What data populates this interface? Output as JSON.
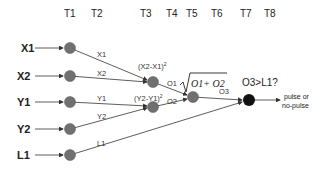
{
  "time_steps": [
    "T1",
    "T2",
    "T3",
    "T4",
    "T5",
    "T6",
    "T7",
    "T8"
  ],
  "inputs": [
    "X1",
    "X2",
    "Y1",
    "Y2",
    "L1"
  ],
  "edges": {
    "x1": "X1",
    "x2": "X2",
    "y1": "Y1",
    "y2": "Y2",
    "l1": "L1",
    "o1": "O1",
    "o2": "O2",
    "o3": "O3"
  },
  "formulas": {
    "dx": "(X2-X1)",
    "dy": "(Y2-Y1)",
    "sq": "2",
    "sqrt": "O1+ O2"
  },
  "decision": "O3>L1?",
  "output_line1": "pulse or",
  "output_line2": "no-pulse",
  "colors": {
    "node": "#707070",
    "output_node": "#111111",
    "line": "#333333"
  }
}
